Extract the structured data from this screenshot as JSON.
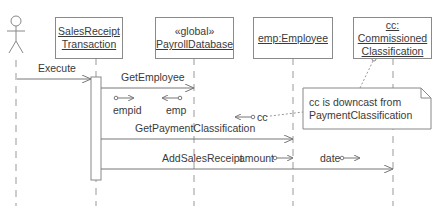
{
  "diagram": {
    "type": "uml-sequence",
    "actor": {
      "name": ""
    },
    "objects": [
      {
        "id": "srt",
        "line1": "SalesReceipt",
        "line2": "Transaction",
        "stereotype": ""
      },
      {
        "id": "pdb",
        "stereotype": "«global»",
        "line1": "PayrollDatabase"
      },
      {
        "id": "emp",
        "line1": "emp:Employee"
      },
      {
        "id": "cc",
        "line1": "cc:",
        "line2": "Commissioned",
        "line3": "Classification"
      }
    ],
    "messages": [
      {
        "label": "Execute",
        "from": "actor",
        "to": "srt"
      },
      {
        "label": "GetEmployee",
        "from": "srt",
        "to": "pdb"
      },
      {
        "label": "GetPaymentClassification",
        "from": "srt",
        "to": "emp"
      },
      {
        "label": "AddSalesReceipt",
        "from": "srt",
        "to": "cc"
      }
    ],
    "params": {
      "empid": "empid",
      "emp": "emp",
      "cc": "cc",
      "amount": "amount",
      "date": "date"
    },
    "note": {
      "line1": "cc is downcast from",
      "line2": "PaymentClassification"
    }
  }
}
